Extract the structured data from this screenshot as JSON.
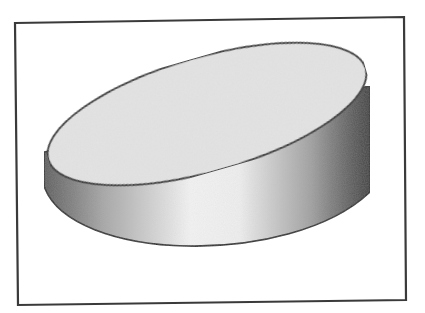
{
  "canvas": {
    "width": 425,
    "height": 313,
    "background": "#ffffff"
  },
  "figure": {
    "type": "cylinder-illustration",
    "frame": {
      "points": [
        [
          15,
          23
        ],
        [
          404,
          17
        ],
        [
          406,
          300
        ],
        [
          18,
          305
        ]
      ],
      "stroke": "#3a3a3a",
      "stroke_width": 2.2
    },
    "cylinder": {
      "top_ellipse": {
        "cx": 207,
        "cy": 114,
        "rx": 165,
        "ry": 57,
        "rotate_deg": -16,
        "fill": "#e4e4e4",
        "stroke": "#2a2a2a",
        "stroke_width": 1.8
      },
      "side": {
        "left_x": 44,
        "left_top_y": 152,
        "left_bottom_y": 186,
        "right_x": 370,
        "right_top_y": 86,
        "right_bottom_y": 192,
        "bottom_curve_ctrl": [
          [
            70,
            262
          ],
          [
            290,
            268
          ]
        ],
        "gradient": [
          {
            "offset": 0.0,
            "color": "#5c5c5c"
          },
          {
            "offset": 0.18,
            "color": "#a6a6a6"
          },
          {
            "offset": 0.45,
            "color": "#f3f3f3"
          },
          {
            "offset": 0.6,
            "color": "#eeeeee"
          },
          {
            "offset": 0.82,
            "color": "#a0a0a0"
          },
          {
            "offset": 0.95,
            "color": "#585858"
          },
          {
            "offset": 1.0,
            "color": "#3e3e3e"
          }
        ],
        "stroke": "#2a2a2a",
        "stroke_width": 1.6
      }
    }
  }
}
